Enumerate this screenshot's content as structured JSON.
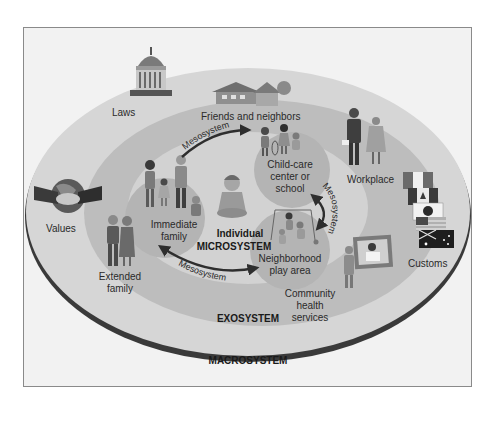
{
  "diagram": {
    "layers": {
      "macrosystem": "MACROSYSTEM",
      "exosystem": "EXOSYSTEM",
      "microsystem": "MICROSYSTEM",
      "individual": "Individual"
    },
    "macro_items": {
      "laws": "Laws",
      "values": "Values",
      "customs": "Customs"
    },
    "exo_items": {
      "friends": "Friends and neighbors",
      "workplace": "Workplace",
      "extended_line1": "Extended",
      "extended_line2": "family",
      "community_line1": "Community",
      "community_line2": "health",
      "community_line3": "services"
    },
    "micro_items": {
      "immediate_line1": "Immediate",
      "immediate_line2": "family",
      "childcare_line1": "Child-care",
      "childcare_line2": "center or",
      "childcare_line3": "school",
      "neighborhood_line1": "Neighborhood",
      "neighborhood_line2": "play area"
    },
    "mesosystem_label": "Mesosystem",
    "colors": {
      "frame_bg": "#f2f2f2",
      "macro_fill": "#d6d6d6",
      "macro_rim": "#3a3a3a",
      "exo_fill": "#bdbdbd",
      "micro_fill": "#d2d2d2",
      "setting_fill": "#b4b4b4",
      "arrow": "#2e2e2e"
    }
  }
}
